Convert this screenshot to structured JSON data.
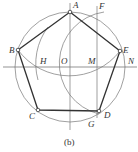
{
  "caption": "(b)",
  "labels": {
    "A": "A",
    "B": "B",
    "C": "C",
    "D": "D",
    "E": "E",
    "F": "F",
    "G": "G",
    "H": "H",
    "M": "M",
    "N": "N",
    "O": "O"
  },
  "colors": {
    "stroke": "#444444",
    "thin": "#777777",
    "background": "#ffffff"
  }
}
